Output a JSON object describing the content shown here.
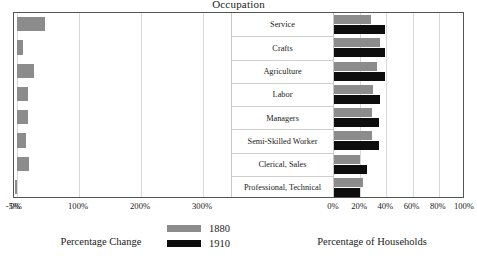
{
  "chart_data": {
    "type": "bar",
    "title": "Occupation",
    "orientation": "horizontal",
    "layout": "two-panel mirrored category axis",
    "grid": true,
    "legend": {
      "position": "bottom-center",
      "entries": [
        {
          "label": "1880",
          "color": "#8c8c8c"
        },
        {
          "label": "1910",
          "color": "#0d0d0d"
        }
      ]
    },
    "categories": [
      "Service",
      "Crafts",
      "Agriculture",
      "Labor",
      "Managers",
      "Semi-Skilled Worker",
      "Clerical, Sales",
      "Professional, Technical"
    ],
    "panels": [
      {
        "id": "percentage-change",
        "xlabel": "Percentage Change",
        "xlim": [
          -5,
          345
        ],
        "ticks": [
          -5,
          0,
          100,
          200,
          300
        ],
        "tick_labels": [
          "-5%",
          "0%",
          "100%",
          "200%",
          "300%"
        ],
        "series": [
          {
            "name": "Percentage Change",
            "color": "#8c8c8c",
            "values": [
              45,
              10,
              27,
              18,
              18,
              15,
              20,
              -3
            ]
          }
        ]
      },
      {
        "id": "percentage-of-households",
        "xlabel": "Percentage of Households",
        "xlim": [
          0,
          100
        ],
        "ticks": [
          0,
          20,
          40,
          60,
          80,
          100
        ],
        "tick_labels": [
          "0%",
          "20%",
          "40%",
          "60%",
          "80%",
          "100%"
        ],
        "series": [
          {
            "name": "1880",
            "color": "#8c8c8c",
            "values": [
              28,
              35,
              33,
              30,
              29,
              29,
              20,
              22
            ]
          },
          {
            "name": "1910",
            "color": "#0d0d0d",
            "values": [
              39,
              39,
              39,
              35,
              34,
              34,
              25,
              20
            ]
          }
        ]
      }
    ]
  }
}
